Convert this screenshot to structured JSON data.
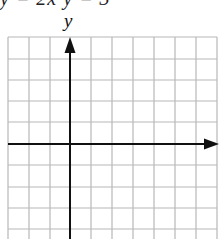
{
  "header": {
    "clipped_equation_text": "y = 2x    y = 3"
  },
  "graph": {
    "y_axis_label": "y",
    "x_axis_label": "",
    "grid": {
      "columns": 10,
      "rows_visible": 10,
      "cell_size_px": 21,
      "line_color": "#b8b8b8",
      "axis_color": "#111111"
    }
  }
}
